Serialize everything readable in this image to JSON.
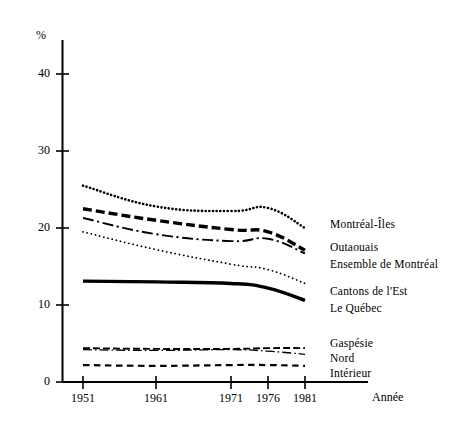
{
  "chart_data": {
    "type": "line",
    "title": "",
    "subtitle": "",
    "xlabel": "Année",
    "ylabel": "%",
    "x": [
      1951,
      1961,
      1971,
      1976,
      1981
    ],
    "xtick_labels": [
      "1951",
      "1961",
      "1971",
      "1976",
      "1981"
    ],
    "ytick_labels": [
      "0",
      "10",
      "20",
      "30",
      "40"
    ],
    "yticks": [
      0,
      10,
      20,
      30,
      40
    ],
    "ylim": [
      0,
      45
    ],
    "xlim": [
      1947,
      1985
    ],
    "grid": false,
    "legend_position": "right-inline",
    "series": [
      {
        "name": "Montréal-Îles",
        "style": "densely-dotted-bold",
        "values": [
          25.5,
          22.8,
          22.2,
          22.6,
          20.0
        ]
      },
      {
        "name": "Outaouais",
        "style": "bold-dashed",
        "values": [
          22.5,
          21.0,
          19.8,
          19.5,
          17.1
        ]
      },
      {
        "name": "Ensemble de Montréal",
        "style": "dash-dot",
        "values": [
          21.3,
          19.2,
          18.3,
          18.6,
          16.7
        ]
      },
      {
        "name": "Cantons de l'Est",
        "style": "fine-dotted",
        "values": [
          19.5,
          17.2,
          15.3,
          14.6,
          12.8
        ]
      },
      {
        "name": "Le Québec",
        "style": "bold-solid",
        "values": [
          13.1,
          13.0,
          12.8,
          12.2,
          10.6
        ]
      },
      {
        "name": "Gaspésie",
        "style": "short-dashed",
        "values": [
          4.4,
          4.3,
          4.3,
          4.4,
          4.4
        ]
      },
      {
        "name": "Nord",
        "style": "thin-dash-dot",
        "values": [
          4.2,
          4.1,
          4.2,
          4.0,
          3.6
        ]
      },
      {
        "name": "Intérieur",
        "style": "dashed",
        "values": [
          2.2,
          2.1,
          2.2,
          2.2,
          2.1
        ]
      }
    ],
    "legend_entries": [
      {
        "label": "Montréal-Îles"
      },
      {
        "label": "Outaouais"
      },
      {
        "label": "Ensemble de Montréal"
      },
      {
        "label": "Cantons de l'Est"
      },
      {
        "label": "Le Québec"
      },
      {
        "label": "Gaspésie"
      },
      {
        "label": "Nord"
      },
      {
        "label": "Intérieur"
      }
    ]
  },
  "axes": {
    "y_unit_label": "%",
    "x_axis_caption": "Année"
  },
  "colors": {
    "ink": "#000000",
    "background": "#ffffff"
  }
}
